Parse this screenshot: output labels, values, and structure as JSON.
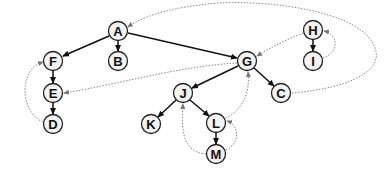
{
  "diagram": {
    "type": "directed-graph",
    "nodes": [
      {
        "id": "A",
        "label": "A",
        "x": 118,
        "y": 31
      },
      {
        "id": "B",
        "label": "B",
        "x": 118,
        "y": 61
      },
      {
        "id": "F",
        "label": "F",
        "x": 53,
        "y": 61
      },
      {
        "id": "E",
        "label": "E",
        "x": 53,
        "y": 93
      },
      {
        "id": "D",
        "label": "D",
        "x": 53,
        "y": 124
      },
      {
        "id": "G",
        "label": "G",
        "x": 247,
        "y": 61
      },
      {
        "id": "C",
        "label": "C",
        "x": 281,
        "y": 93
      },
      {
        "id": "H",
        "label": "H",
        "x": 313,
        "y": 30
      },
      {
        "id": "I",
        "label": "I",
        "x": 313,
        "y": 61
      },
      {
        "id": "J",
        "label": "J",
        "x": 183,
        "y": 93
      },
      {
        "id": "K",
        "label": "K",
        "x": 151,
        "y": 124
      },
      {
        "id": "L",
        "label": "L",
        "x": 216,
        "y": 123
      },
      {
        "id": "M",
        "label": "M",
        "x": 216,
        "y": 154
      }
    ],
    "solid_edges": [
      {
        "from": "A",
        "to": "F"
      },
      {
        "from": "A",
        "to": "B"
      },
      {
        "from": "A",
        "to": "G"
      },
      {
        "from": "F",
        "to": "E"
      },
      {
        "from": "E",
        "to": "D"
      },
      {
        "from": "G",
        "to": "J"
      },
      {
        "from": "G",
        "to": "C"
      },
      {
        "from": "J",
        "to": "K"
      },
      {
        "from": "J",
        "to": "L"
      },
      {
        "from": "L",
        "to": "M"
      },
      {
        "from": "H",
        "to": "I"
      }
    ],
    "dotted_edges": [
      {
        "from": "D",
        "to": "F"
      },
      {
        "from": "G",
        "to": "E"
      },
      {
        "from": "C",
        "to": "A"
      },
      {
        "from": "H",
        "to": "G"
      },
      {
        "from": "I",
        "to": "H"
      },
      {
        "from": "L",
        "to": "G"
      },
      {
        "from": "M",
        "to": "J"
      },
      {
        "from": "M",
        "to": "L"
      }
    ]
  }
}
